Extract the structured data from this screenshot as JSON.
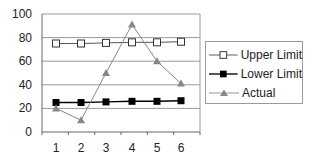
{
  "chart_data": {
    "type": "line",
    "title": "",
    "xlabel": "",
    "ylabel": "",
    "x": [
      1,
      2,
      3,
      4,
      5,
      6
    ],
    "categories": [
      "1",
      "2",
      "3",
      "4",
      "5",
      "6"
    ],
    "ylim": [
      0,
      100
    ],
    "yticks": [
      0,
      20,
      40,
      60,
      80,
      100
    ],
    "grid": true,
    "legend_position": "right",
    "series": [
      {
        "name": "Upper Limit",
        "marker": "square-open",
        "color": "#555555",
        "values": [
          75,
          75,
          75.5,
          76,
          76,
          76.5
        ]
      },
      {
        "name": "Lower Limit",
        "marker": "square-filled",
        "color": "#000000",
        "values": [
          25,
          25,
          25.5,
          26,
          26,
          26.5
        ]
      },
      {
        "name": "Actual",
        "marker": "triangle",
        "color": "#888888",
        "values": [
          20,
          10,
          50,
          91,
          60,
          41
        ]
      }
    ]
  },
  "legend": {
    "items": [
      {
        "label": "Upper Limit"
      },
      {
        "label": "Lower Limit"
      },
      {
        "label": "Actual"
      }
    ]
  }
}
